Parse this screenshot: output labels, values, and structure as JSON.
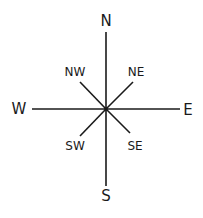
{
  "diagram": {
    "type": "compass-rose",
    "line_color": "#1a1a1a",
    "label_color": "#1a1a1a",
    "background": "#ffffff",
    "center": {
      "x": 106,
      "y": 109
    },
    "cardinal": {
      "north": "N",
      "south": "S",
      "east": "E",
      "west": "W"
    },
    "intercardinal": {
      "northwest": "NW",
      "northeast": "NE",
      "southwest": "SW",
      "southeast": "SE"
    }
  }
}
